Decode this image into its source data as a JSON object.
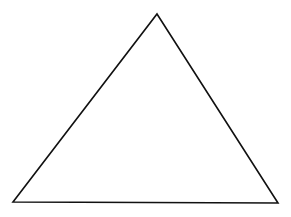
{
  "diagram": {
    "type": "triangle",
    "background": "#ffffff",
    "stroke_color": "#111111",
    "stroke_width": 1.6,
    "fill": "none",
    "vertices": {
      "apex": [
        157,
        14
      ],
      "bottom_left": [
        13,
        202
      ],
      "bottom_right": [
        278,
        203
      ]
    }
  }
}
